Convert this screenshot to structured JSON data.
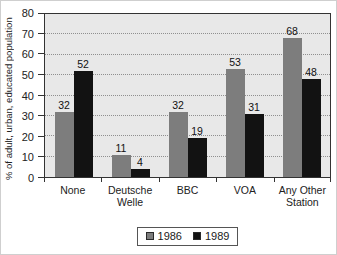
{
  "chart_data": {
    "type": "bar",
    "title": "",
    "categories": [
      "None",
      "Deutsche Welle",
      "BBC",
      "VOA",
      "Any Other Station"
    ],
    "series": [
      {
        "name": "1986",
        "color": "#7d7d7d",
        "values": [
          32,
          11,
          32,
          53,
          68
        ]
      },
      {
        "name": "1989",
        "color": "#121212",
        "values": [
          52,
          4,
          19,
          31,
          48
        ]
      }
    ],
    "xlabel": "",
    "ylabel": "% of adult, urban, educated population",
    "ylim": [
      0,
      80
    ],
    "yticks": [
      0,
      10,
      20,
      30,
      40,
      50,
      60,
      70,
      80
    ],
    "grid": "horizontal-dotted",
    "value_labels": true,
    "legend_position": "bottom"
  },
  "style": {
    "plot_background": "#e8e8e8",
    "gridline_color": "#8f8f8f",
    "frame_color": "#333333",
    "text_color": "#1f1f1f",
    "series_colors": {
      "1986": "#7d7d7d",
      "1989": "#121212"
    }
  }
}
